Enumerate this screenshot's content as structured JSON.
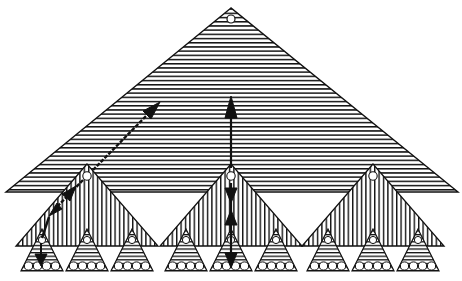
{
  "diagram": {
    "type": "hierarchical-triangle-tree",
    "colors": {
      "ink": "#111111",
      "background": "#ffffff"
    },
    "levels": [
      {
        "name": "top",
        "count": 1,
        "hatch": "horizontal"
      },
      {
        "name": "middle",
        "count": 3,
        "hatch": "vertical"
      },
      {
        "name": "leaf",
        "count": 9,
        "hatch": "horizontal",
        "leaf_circles_per_triangle": 4
      }
    ],
    "arrows": [
      {
        "name": "diagonal-double-arrow",
        "from": "top-level interior",
        "to": "left middle triangle apex"
      },
      {
        "name": "left-descend-arrow",
        "from": "left middle apex",
        "to": "left leaf triangle"
      },
      {
        "name": "vertical-up-arrow",
        "from": "center middle apex",
        "to": "top-level interior"
      },
      {
        "name": "vertical-double-arrow",
        "from": "center middle apex",
        "to": "center leaf triangle"
      }
    ]
  }
}
